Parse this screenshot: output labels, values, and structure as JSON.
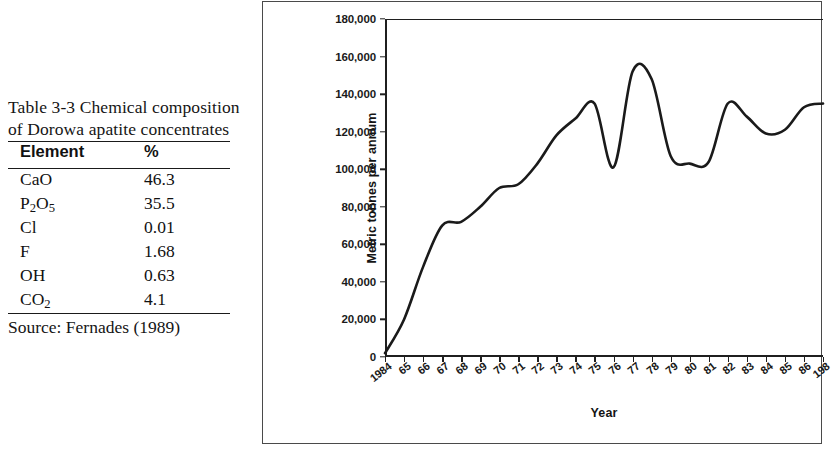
{
  "table": {
    "caption": "Table 3-3 Chemical composition of Dorowa apatite concentrates",
    "columns": [
      "Element",
      "%"
    ],
    "rows": [
      {
        "element": "CaO",
        "element_main": "CaO",
        "element_sub": "",
        "value": "46.3"
      },
      {
        "element": "P2O5",
        "element_main": "P",
        "element_sub": "2",
        "element_mid": "O",
        "element_sub2": "5",
        "value": "35.5"
      },
      {
        "element": "Cl",
        "element_main": "Cl",
        "element_sub": "",
        "value": "0.01"
      },
      {
        "element": "F",
        "element_main": "F",
        "element_sub": "",
        "value": "1.68"
      },
      {
        "element": "OH",
        "element_main": "OH",
        "element_sub": "",
        "value": "0.63"
      },
      {
        "element": "CO2",
        "element_main": "CO",
        "element_sub": "2",
        "value": "4.1"
      }
    ],
    "source": "Source: Fernades (1989)"
  },
  "chart_data": {
    "type": "line",
    "title": "",
    "xlabel": "Year",
    "ylabel": "Metric tonnes per annum",
    "ylim": [
      0,
      180000
    ],
    "ytick_labels": [
      "180,000",
      "160,000",
      "140,000",
      "120,000",
      "100,000",
      "80,000",
      "60,000",
      "40,000",
      "20,000",
      "0"
    ],
    "ytick_values": [
      180000,
      160000,
      140000,
      120000,
      100000,
      80000,
      60000,
      40000,
      20000,
      0
    ],
    "grid": false,
    "legend": "none",
    "line_color": "#1a1a1a",
    "categories": [
      "1984",
      "65",
      "66",
      "67",
      "68",
      "69",
      "70",
      "71",
      "72",
      "73",
      "74",
      "75",
      "76",
      "77",
      "78",
      "79",
      "80",
      "81",
      "82",
      "83",
      "84",
      "85",
      "86",
      "198"
    ],
    "values": [
      2000,
      20000,
      48000,
      70000,
      72000,
      80000,
      90000,
      92000,
      103000,
      118000,
      127000,
      135000,
      101000,
      152000,
      148000,
      107000,
      103000,
      104000,
      135000,
      128000,
      119000,
      121000,
      133000,
      135000
    ],
    "note_axis_truncated": "last label clipped at image edge"
  }
}
